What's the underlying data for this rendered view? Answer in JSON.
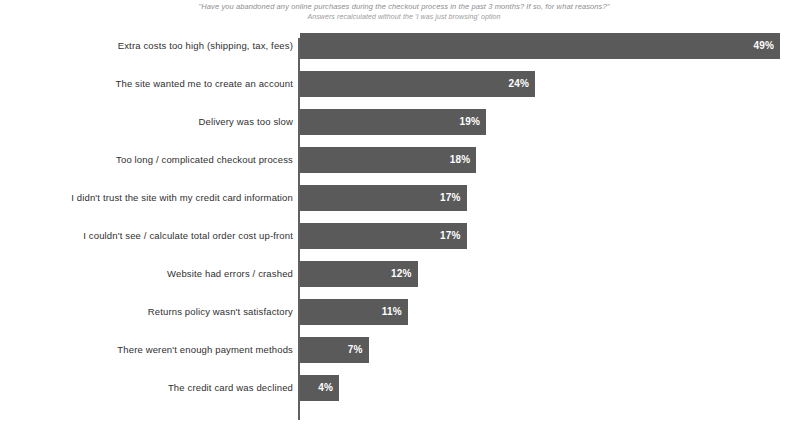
{
  "chart_data": {
    "type": "bar",
    "orientation": "horizontal",
    "title": "\"Have you abandoned any online purchases during the checkout process in the past 3 months? If so, for what reasons?\"",
    "subtitle": "Answers recalculated without the 'I was just browsing' option",
    "xlabel": "",
    "ylabel": "",
    "xlim": [
      0,
      49
    ],
    "grid": false,
    "legend": false,
    "bar_color": "#5a5a5a",
    "value_label_color": "#ffffff",
    "background_color": "#ffffff",
    "value_suffix": "%",
    "categories": [
      "Extra costs too high (shipping, tax, fees)",
      "The site wanted me to create an account",
      "Delivery was too slow",
      "Too long / complicated checkout process",
      "I didn't trust the site with my credit card information",
      "I couldn't see / calculate total order cost up-front",
      "Website had errors / crashed",
      "Returns policy wasn't satisfactory",
      "There weren't enough payment methods",
      "The credit card was declined"
    ],
    "values": [
      49,
      24,
      19,
      18,
      17,
      17,
      12,
      11,
      7,
      4
    ],
    "value_labels": [
      "49%",
      "24%",
      "19%",
      "18%",
      "17%",
      "17%",
      "12%",
      "11%",
      "7%",
      "4%"
    ]
  }
}
